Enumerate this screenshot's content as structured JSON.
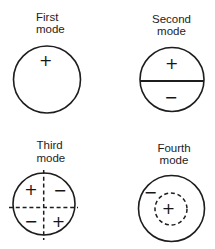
{
  "figure": {
    "background": "#ffffff",
    "ink": "#1d1d1d"
  },
  "modes": [
    {
      "label": [
        "First",
        "mode"
      ],
      "signs": {
        "center": "+"
      }
    },
    {
      "label": [
        "Second",
        "mode"
      ],
      "signs": {
        "top": "+",
        "bottom": "−"
      }
    },
    {
      "label": [
        "Third",
        "mode"
      ],
      "signs": {
        "top_left": "+",
        "top_right": "−",
        "bottom_left": "−",
        "bottom_right": "+"
      }
    },
    {
      "label": [
        "Fourth",
        "mode"
      ],
      "signs": {
        "inner_center": "+",
        "outer_region": "−"
      }
    }
  ]
}
